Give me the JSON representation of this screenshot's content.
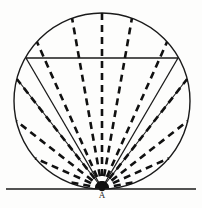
{
  "figure": {
    "type": "geometric-diagram",
    "background_color": "#fdfdfc",
    "ink_color": "#111111",
    "canvas": {
      "width": 202,
      "height": 208
    }
  },
  "labels": {
    "tangent_point": "A"
  },
  "geometry": {
    "circle": {
      "center_x": 102,
      "center_y": 101,
      "radius": 88,
      "stroke_width": 1.4,
      "style": "solid"
    },
    "baseline": {
      "name": "ground-line",
      "x1": 6,
      "y1": 189,
      "x2": 196,
      "y2": 189,
      "stroke_width": 1.6,
      "style": "solid"
    },
    "chord": {
      "name": "horizontal-chord",
      "y": 58,
      "x1": 26,
      "x2": 178,
      "stroke_width": 1.5,
      "style": "solid"
    },
    "apex": {
      "x": 102,
      "y": 188
    },
    "apex_dot_radius": 3.2,
    "dashed_rays": {
      "count": 13,
      "stroke_width": 2.6,
      "dash_pattern": "7 5",
      "angles_deg": [
        10,
        24,
        38,
        52,
        66,
        80,
        90,
        100,
        114,
        128,
        142,
        156,
        170
      ],
      "note": "angles measured from positive x-axis at apex A, sweeping counter-clockwise across the upper half"
    },
    "solid_rays": {
      "count": 2,
      "stroke_width": 1.3,
      "endpoints": [
        {
          "x": 26,
          "y": 58
        },
        {
          "x": 178,
          "y": 58
        }
      ]
    },
    "solid_minor_rays": {
      "count": 2,
      "stroke_width": 1.1,
      "endpoints": [
        {
          "x": 17,
          "y": 79
        },
        {
          "x": 187,
          "y": 79
        }
      ]
    }
  }
}
